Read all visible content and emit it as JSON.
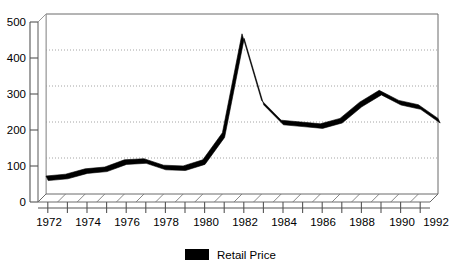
{
  "chart_data": {
    "type": "line",
    "title": "",
    "subtitle": "",
    "xlabel": "",
    "ylabel": "",
    "xlim": [
      1972,
      1992
    ],
    "ylim": [
      0,
      500
    ],
    "yticks": [
      0,
      100,
      200,
      300,
      400,
      500
    ],
    "ytick_labels": [
      "0",
      "100",
      "200",
      "300",
      "400",
      "500"
    ],
    "xticks": [
      1972,
      1973,
      1974,
      1975,
      1976,
      1977,
      1978,
      1979,
      1980,
      1981,
      1982,
      1983,
      1984,
      1985,
      1986,
      1987,
      1988,
      1989,
      1990,
      1991,
      1992
    ],
    "xtick_labels": [
      "1972",
      "",
      "1974",
      "",
      "1976",
      "",
      "1978",
      "",
      "1980",
      "",
      "1982",
      "",
      "1984",
      "",
      "1986",
      "",
      "1988",
      "",
      "1990",
      "",
      "1992"
    ],
    "xtick_labels_shown": [
      "1972",
      "1974",
      "1976",
      "1978",
      "1980",
      "1982",
      "1984",
      "1986",
      "1988",
      "1990",
      "1992"
    ],
    "grid": true,
    "grid_style": "dotted-horizontal",
    "legend_position": "bottom-center",
    "series": [
      {
        "name": "Retail Price",
        "color": "#000000",
        "x": [
          1972,
          1973,
          1974,
          1975,
          1976,
          1977,
          1978,
          1979,
          1980,
          1981,
          1982,
          1983,
          1984,
          1985,
          1986,
          1987,
          1988,
          1989,
          1990,
          1991,
          1992
        ],
        "values": [
          50,
          55,
          70,
          75,
          95,
          98,
          80,
          78,
          95,
          170,
          445,
          260,
          205,
          200,
          195,
          210,
          255,
          288,
          260,
          248,
          210
        ]
      }
    ]
  },
  "axes": {
    "y_tick_labels": [
      "500",
      "400",
      "300",
      "200",
      "100",
      "0"
    ],
    "x_tick_labels": [
      "1972",
      "1974",
      "1976",
      "1978",
      "1980",
      "1982",
      "1984",
      "1986",
      "1988",
      "1990",
      "1992"
    ]
  },
  "legend": {
    "entries": [
      {
        "label": "Retail Price",
        "color": "#000000",
        "swatch": "legend-swatch-retail-price"
      }
    ]
  },
  "colors": {
    "series": "#000000",
    "grid": "#9a9a9a",
    "axis": "#4d4d4d",
    "background": "#ffffff",
    "floor": "#ffffff"
  }
}
